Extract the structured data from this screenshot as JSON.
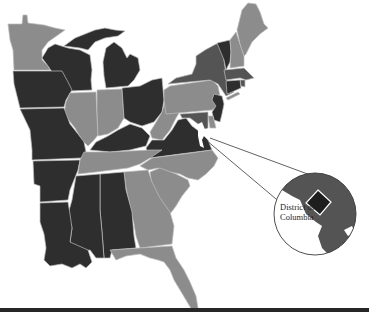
{
  "map": {
    "region": "Eastern United States",
    "shades": {
      "dark": "#2e2e2e",
      "medium": "#545454",
      "light": "#8c8c8c",
      "border": "#bdbdbd",
      "background": "#ffffff"
    },
    "states": [
      {
        "name": "Minnesota",
        "shade": "light"
      },
      {
        "name": "Wisconsin",
        "shade": "dark"
      },
      {
        "name": "Michigan",
        "shade": "dark"
      },
      {
        "name": "Iowa",
        "shade": "dark"
      },
      {
        "name": "Illinois",
        "shade": "light"
      },
      {
        "name": "Indiana",
        "shade": "light"
      },
      {
        "name": "Ohio",
        "shade": "dark"
      },
      {
        "name": "Missouri",
        "shade": "dark"
      },
      {
        "name": "Kentucky",
        "shade": "dark"
      },
      {
        "name": "West Virginia",
        "shade": "light"
      },
      {
        "name": "Pennsylvania",
        "shade": "light"
      },
      {
        "name": "New York",
        "shade": "medium"
      },
      {
        "name": "Vermont",
        "shade": "dark"
      },
      {
        "name": "New Hampshire",
        "shade": "light"
      },
      {
        "name": "Maine",
        "shade": "light"
      },
      {
        "name": "Massachusetts",
        "shade": "medium"
      },
      {
        "name": "Connecticut",
        "shade": "dark"
      },
      {
        "name": "Rhode Island",
        "shade": "medium"
      },
      {
        "name": "New Jersey",
        "shade": "dark"
      },
      {
        "name": "Delaware",
        "shade": "light"
      },
      {
        "name": "Maryland",
        "shade": "medium"
      },
      {
        "name": "Virginia",
        "shade": "dark"
      },
      {
        "name": "Arkansas",
        "shade": "dark"
      },
      {
        "name": "Tennessee",
        "shade": "light"
      },
      {
        "name": "North Carolina",
        "shade": "light"
      },
      {
        "name": "South Carolina",
        "shade": "light"
      },
      {
        "name": "Georgia",
        "shade": "light"
      },
      {
        "name": "Alabama",
        "shade": "dark"
      },
      {
        "name": "Mississippi",
        "shade": "dark"
      },
      {
        "name": "Louisiana",
        "shade": "dark"
      },
      {
        "name": "Florida",
        "shade": "light"
      }
    ],
    "inset": {
      "label": "District of Columbia",
      "label_line1": "District of",
      "label_line2": "Columbia",
      "dc_shade": "dark",
      "surround_shade": "medium"
    }
  }
}
